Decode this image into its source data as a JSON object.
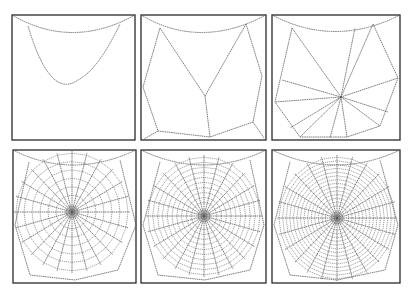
{
  "figure": {
    "panels": [
      {
        "id": 1,
        "stage": "bridge-thread",
        "x": 12,
        "y": 15,
        "w": 123,
        "h": 125
      },
      {
        "id": 2,
        "stage": "frame-and-y",
        "x": 141,
        "y": 15,
        "w": 125,
        "h": 125
      },
      {
        "id": 3,
        "stage": "radii",
        "x": 272,
        "y": 15,
        "w": 128,
        "h": 125
      },
      {
        "id": 4,
        "stage": "temporary-spiral",
        "x": 13,
        "y": 150,
        "w": 123,
        "h": 133,
        "hub": [
          72,
          212
        ],
        "rings": 6
      },
      {
        "id": 5,
        "stage": "sticky-spiral-partial",
        "x": 141,
        "y": 150,
        "w": 125,
        "h": 133,
        "hub": [
          204,
          216
        ],
        "rings": 10
      },
      {
        "id": 6,
        "stage": "sticky-spiral-complete",
        "x": 272,
        "y": 150,
        "w": 128,
        "h": 133,
        "hub": [
          337,
          218
        ],
        "rings": 14
      }
    ],
    "colors": {
      "line": "#2a2a2a",
      "thread": "#555555",
      "background": "#ffffff"
    }
  }
}
